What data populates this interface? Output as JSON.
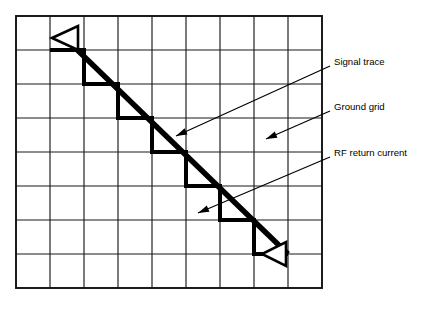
{
  "figure": {
    "background_color": "#ffffff",
    "ink_color": "#000000",
    "width": 432,
    "height": 322
  },
  "grid": {
    "name": "ground grid",
    "columns": 9,
    "rows": 8,
    "cell_size": 34,
    "origin_x": 16,
    "origin_y": 16,
    "line_color": "#1a1a1a",
    "border_color": "#111111"
  },
  "callouts": [
    {
      "id": "signal-trace",
      "label": "Signal trace",
      "text_x": 334,
      "text_y": 62,
      "leader_from_x": 330,
      "leader_from_y": 66,
      "leader_to_x": 176,
      "leader_to_y": 136
    },
    {
      "id": "ground-grid",
      "label": "Ground grid",
      "text_x": 334,
      "text_y": 107,
      "leader_from_x": 330,
      "leader_from_y": 111,
      "leader_to_x": 266,
      "leader_to_y": 139
    },
    {
      "id": "rf-return-current",
      "label": "RF return current",
      "text_x": 334,
      "text_y": 153,
      "leader_from_x": 330,
      "leader_from_y": 157,
      "leader_to_x": 198,
      "leader_to_y": 213
    }
  ],
  "signal_trace": {
    "description": "thick diagonal conductor running upper-left to lower-right",
    "start_x": 66,
    "start_y": 39,
    "end_x": 288,
    "end_y": 254
  },
  "return_path": {
    "description": "staircase RF return current following the ground grid under the trace",
    "points": "50,50 84,50 84,84 118,84 118,118 152,118 152,152 186,152 186,186 220,186 220,220 254,220 254,254 288,254"
  },
  "arrowheads": [
    {
      "id": "start-arrowhead",
      "direction": "left",
      "points": "52,38 78,26 78,50"
    },
    {
      "id": "end-arrowhead",
      "direction": "right",
      "points": "286,242 286,266 262,254"
    }
  ]
}
